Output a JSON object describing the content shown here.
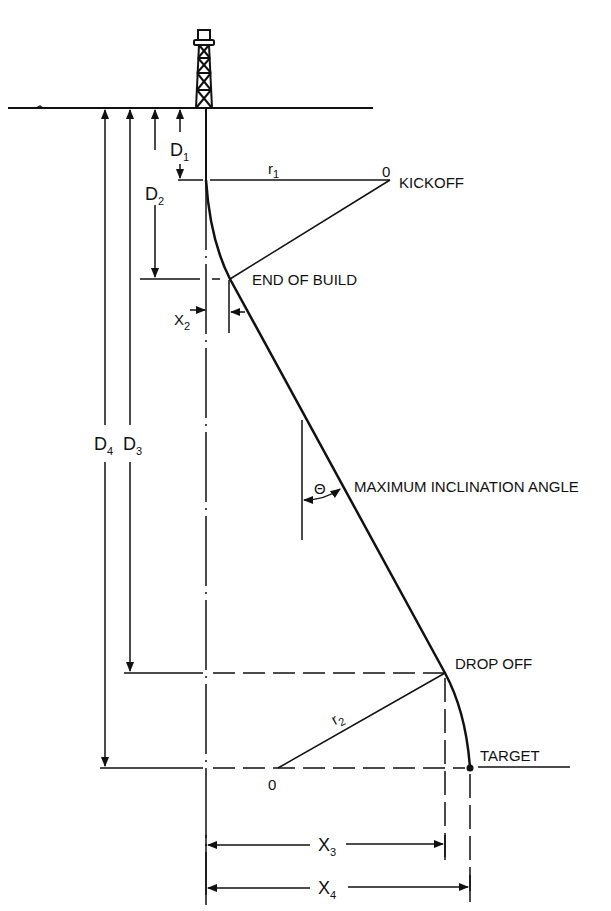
{
  "diagram": {
    "type": "directional-well-profile",
    "labels": {
      "kickoff": "KICKOFF",
      "end_of_build": "END OF BUILD",
      "max_inclination": "MAXIMUM INCLINATION ANGLE",
      "drop_off": "DROP OFF",
      "target": "TARGET",
      "theta": "Θ",
      "center_1": "0",
      "center_2": "0"
    },
    "dimensions": {
      "D1": {
        "main": "D",
        "sub": "1"
      },
      "D2": {
        "main": "D",
        "sub": "2"
      },
      "D3": {
        "main": "D",
        "sub": "3"
      },
      "D4": {
        "main": "D",
        "sub": "4"
      },
      "X2": {
        "main": "X",
        "sub": "2"
      },
      "X3": {
        "main": "X",
        "sub": "3"
      },
      "X4": {
        "main": "X",
        "sub": "4"
      },
      "r1": {
        "main": "r",
        "sub": "1"
      },
      "r2": {
        "main": "r",
        "sub": "2"
      }
    },
    "colors": {
      "ink": "#111111",
      "background": "#ffffff"
    }
  }
}
